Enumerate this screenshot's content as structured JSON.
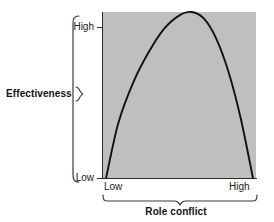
{
  "chart_data": {
    "type": "line",
    "title": "",
    "subtitle": "",
    "xlabel": "Role conflict",
    "ylabel": "Effectiveness",
    "x_tick_labels": [
      "Low",
      "High"
    ],
    "y_tick_labels": [
      "Low",
      "High"
    ],
    "xlim": [
      0,
      1
    ],
    "ylim": [
      0,
      1
    ],
    "grid": false,
    "legend": null,
    "annotations": [],
    "series": [
      {
        "name": "Effectiveness vs Role conflict",
        "shape": "inverted-U",
        "color": "#111111",
        "x": [
          0.02,
          0.1,
          0.2,
          0.3,
          0.4,
          0.5,
          0.58,
          0.66,
          0.74,
          0.82,
          0.9,
          0.98
        ],
        "y": [
          0.0,
          0.33,
          0.58,
          0.76,
          0.9,
          0.98,
          1.0,
          0.96,
          0.84,
          0.64,
          0.36,
          0.0
        ]
      }
    ]
  },
  "axes": {
    "y": {
      "label": "Effectiveness",
      "high": "High",
      "low": "Low"
    },
    "x": {
      "label": "Role conflict",
      "low": "Low",
      "high": "High"
    }
  },
  "style": {
    "plot_background": "#bfbfbf",
    "curve_color": "#111111",
    "axis_color": "#2b2b2b",
    "text_color": "#111111",
    "page_background": "#ffffff"
  },
  "icons": {
    "brace_left": "curly-brace-vertical",
    "brace_bottom": "curly-brace-horizontal",
    "eff_pointer": "curly-brace-pointer"
  }
}
